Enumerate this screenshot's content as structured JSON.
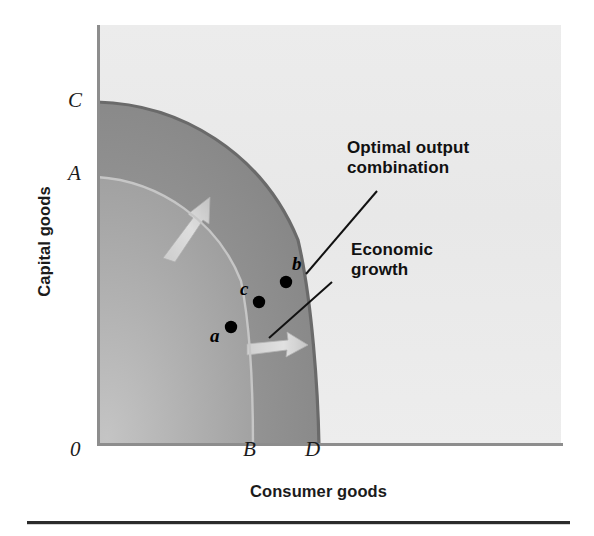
{
  "figure": {
    "type": "production-possibilities-frontier",
    "axes": {
      "y_title": "Capital goods",
      "x_title": "Consumer goods",
      "origin_label": "0"
    },
    "tick_labels": {
      "y": [
        {
          "id": "C",
          "text": "C",
          "meaning": "capital-goods intercept of expanded frontier"
        },
        {
          "id": "A",
          "text": "A",
          "meaning": "capital-goods intercept of original frontier"
        }
      ],
      "x": [
        {
          "id": "B",
          "text": "B",
          "meaning": "consumer-goods intercept of original frontier"
        },
        {
          "id": "D",
          "text": "D",
          "meaning": "consumer-goods intercept of expanded frontier"
        }
      ]
    },
    "points": [
      {
        "id": "a",
        "label": "a",
        "on_curve": "AB",
        "description": "point on original frontier"
      },
      {
        "id": "b",
        "label": "b",
        "on_curve": "CD",
        "description": "point on expanded frontier"
      },
      {
        "id": "c",
        "label": "c",
        "on_curve": "interior",
        "description": "point between frontiers"
      }
    ],
    "callouts": [
      {
        "id": "optimal",
        "text": "Optimal output\ncombination",
        "points_to": "b"
      },
      {
        "id": "growth",
        "text": "Economic\ngrowth",
        "points_to": "region-between-frontiers"
      }
    ],
    "curves": [
      {
        "id": "AB",
        "name": "original production possibilities frontier",
        "from": "A",
        "to": "B"
      },
      {
        "id": "CD",
        "name": "expanded production possibilities frontier",
        "from": "C",
        "to": "D"
      }
    ],
    "arrows": [
      {
        "id": "growth-arrow-upper",
        "direction": "up-right",
        "meaning": "outward shift of frontier"
      },
      {
        "id": "growth-arrow-lower",
        "direction": "right",
        "meaning": "outward shift of frontier"
      }
    ],
    "colors": {
      "plot_background": "#e9e9e9",
      "inner_region": "#a9a9a9",
      "growth_band": "#8f8f8f",
      "frontier_outer_stroke": "#6d6d6d",
      "frontier_inner_stroke": "#bfbfbf",
      "axis_stroke": "#8d8d8d",
      "text": "#1b1b1b",
      "rule": "#2b2b2b"
    }
  }
}
